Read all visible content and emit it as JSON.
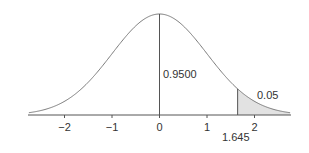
{
  "chart_data": {
    "type": "area",
    "title": "",
    "xlabel": "",
    "ylabel": "",
    "distribution": "standard normal",
    "xlim": [
      -2.75,
      2.75
    ],
    "x_ticks": [
      -2,
      -1,
      0,
      1,
      2
    ],
    "x_tick_labels": [
      "−2",
      "−1",
      "0",
      "1",
      "2"
    ],
    "grid": false,
    "legend": null,
    "center_line_x": 0,
    "critical_value": 1.645,
    "critical_value_label": "1.645",
    "shaded_region": {
      "from": 1.645,
      "to": 2.75,
      "area": 0.05
    },
    "annotations": [
      {
        "text": "0.9500",
        "meaning": "area left of critical value"
      },
      {
        "text": "0.05",
        "meaning": "upper tail area"
      }
    ]
  },
  "colors": {
    "curve": "#7a7a7a",
    "axis": "#555555",
    "shade": "#e2e2e2",
    "text": "#333333"
  }
}
